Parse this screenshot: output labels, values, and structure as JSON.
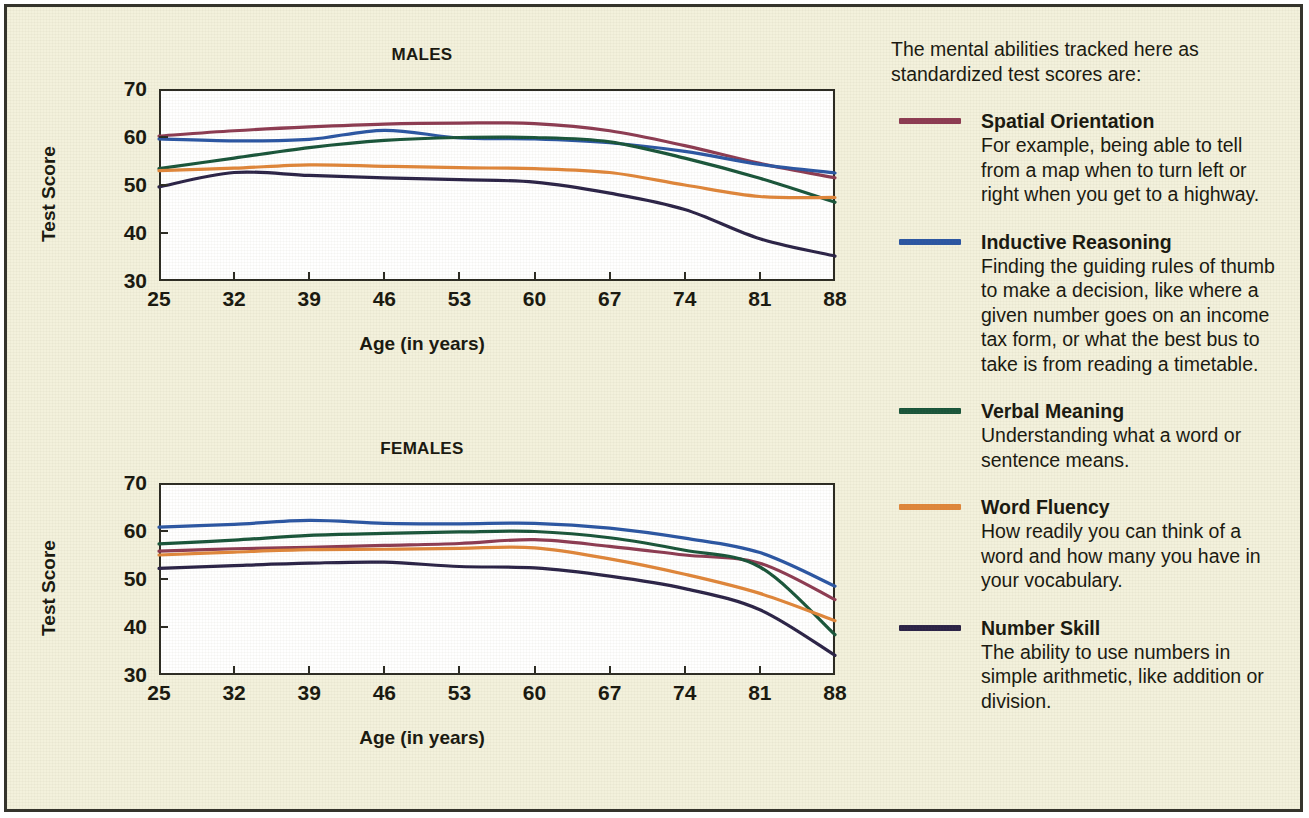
{
  "legend": {
    "intro": "The mental abilities tracked here as standardized test scores are:",
    "entries": [
      {
        "name": "Spatial Orientation",
        "desc": "For example, being able to tell from a map when to turn left or right when you get to a highway.",
        "color": "#8d3b52"
      },
      {
        "name": "Inductive Reasoning",
        "desc": "Finding the guiding rules of thumb to make a decision, like where a given number goes on an income tax form, or what the best bus to take is from reading a timetable.",
        "color": "#2b56a3"
      },
      {
        "name": "Verbal Meaning",
        "desc": "Understanding what a word or sentence means.",
        "color": "#19553a"
      },
      {
        "name": "Word Fluency",
        "desc": "How readily you can think of a word and how many you have in your vocabulary.",
        "color": "#e0863a"
      },
      {
        "name": "Number Skill",
        "desc": "The ability to use numbers in simple arithmetic, like addition or division.",
        "color": "#2b2347"
      }
    ]
  },
  "chart_data": [
    {
      "type": "line",
      "title": "MALES",
      "xlabel": "Age (in years)",
      "ylabel": "Test Score",
      "xlim": [
        25,
        88
      ],
      "ylim": [
        30,
        70
      ],
      "xticks": [
        25,
        32,
        39,
        46,
        53,
        60,
        67,
        74,
        81,
        88
      ],
      "yticks": [
        30,
        40,
        50,
        60,
        70
      ],
      "grid": false,
      "legend_position": "right-external",
      "x": [
        25,
        32,
        39,
        46,
        53,
        60,
        67,
        74,
        81,
        88
      ],
      "series": [
        {
          "name": "Spatial Orientation",
          "color": "#8d3b52",
          "values": [
            60.2,
            61.3,
            62.1,
            62.7,
            62.9,
            62.8,
            61.3,
            58.2,
            54.5,
            51.5
          ]
        },
        {
          "name": "Inductive Reasoning",
          "color": "#2b56a3",
          "values": [
            59.6,
            59.2,
            59.5,
            61.4,
            59.8,
            59.6,
            58.8,
            57.0,
            54.3,
            52.5
          ]
        },
        {
          "name": "Verbal Meaning",
          "color": "#19553a",
          "values": [
            53.4,
            55.6,
            57.8,
            59.3,
            59.9,
            59.9,
            59.0,
            55.6,
            51.4,
            46.4
          ]
        },
        {
          "name": "Word Fluency",
          "color": "#e0863a",
          "values": [
            53.0,
            53.5,
            54.2,
            53.9,
            53.6,
            53.4,
            52.6,
            50.0,
            47.6,
            47.4
          ]
        },
        {
          "name": "Number Skill",
          "color": "#2b2347",
          "values": [
            49.6,
            52.6,
            52.0,
            51.5,
            51.1,
            50.6,
            48.3,
            44.9,
            38.8,
            35.2
          ]
        }
      ]
    },
    {
      "type": "line",
      "title": "FEMALES",
      "xlabel": "Age (in years)",
      "ylabel": "Test Score",
      "xlim": [
        25,
        88
      ],
      "ylim": [
        30,
        70
      ],
      "xticks": [
        25,
        32,
        39,
        46,
        53,
        60,
        67,
        74,
        81,
        88
      ],
      "yticks": [
        30,
        40,
        50,
        60,
        70
      ],
      "grid": false,
      "legend_position": "right-external",
      "x": [
        25,
        32,
        39,
        46,
        53,
        60,
        67,
        74,
        81,
        88
      ],
      "series": [
        {
          "name": "Spatial Orientation",
          "color": "#8d3b52",
          "values": [
            55.8,
            56.3,
            56.6,
            57.0,
            57.4,
            58.2,
            56.8,
            55.0,
            53.3,
            45.7
          ]
        },
        {
          "name": "Inductive Reasoning",
          "color": "#2b56a3",
          "values": [
            60.8,
            61.4,
            62.2,
            61.6,
            61.5,
            61.6,
            60.6,
            58.5,
            55.5,
            48.5
          ]
        },
        {
          "name": "Verbal Meaning",
          "color": "#19553a",
          "values": [
            57.3,
            58.1,
            59.1,
            59.5,
            59.8,
            59.9,
            58.6,
            56.0,
            52.5,
            38.4
          ]
        },
        {
          "name": "Word Fluency",
          "color": "#e0863a",
          "values": [
            55.0,
            55.6,
            56.1,
            56.2,
            56.4,
            56.5,
            54.2,
            51.0,
            47.0,
            41.3
          ]
        },
        {
          "name": "Number Skill",
          "color": "#2b2347",
          "values": [
            52.2,
            52.8,
            53.3,
            53.5,
            52.6,
            52.3,
            50.6,
            48.0,
            43.6,
            34.1
          ]
        }
      ]
    }
  ]
}
